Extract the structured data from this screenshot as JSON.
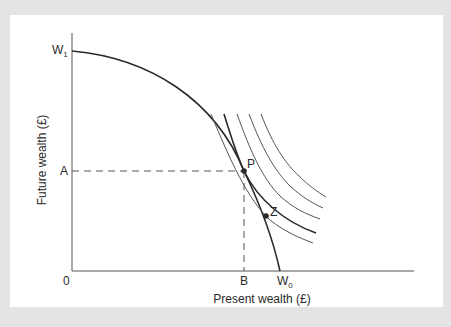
{
  "diagram": {
    "x_axis_label": "Present wealth (£)",
    "y_axis_label": "Future wealth (£)",
    "origin_label": "0",
    "y_intercept_label": {
      "main": "W",
      "sub": "1"
    },
    "x_intercept_label": {
      "main": "W",
      "sub": "0"
    },
    "point_A_label": "A",
    "point_B_label": "B",
    "point_P_label": "P",
    "point_Z_label": "Z",
    "elements": {
      "production_possibility_curve": "Concave curve from W1 on future-wealth axis to W0 on present-wealth axis",
      "indifference_curves": 5,
      "tangent_indifference_curve": "Thicker curve tangent to frontier at P",
      "dashed_guides": "From A horizontally to P, from P vertically down to B"
    },
    "colors": {
      "background": "#e4e4e4",
      "panel": "#ffffff",
      "line": "#2a2a2a",
      "thin_line": "#555555"
    }
  }
}
